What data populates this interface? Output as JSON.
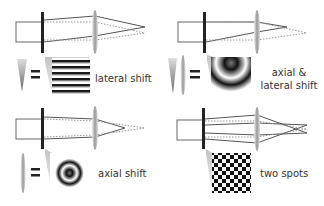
{
  "figure": {
    "panels": [
      {
        "id": "lateral",
        "label_lines": [
          "lateral shift"
        ],
        "pattern": "horizontal-fringes",
        "element_icons": [
          "wedge-prism"
        ]
      },
      {
        "id": "axial-lateral",
        "label_lines": [
          "axial &",
          "lateral shift"
        ],
        "pattern": "off-center-rings",
        "element_icons": [
          "wedge-prism",
          "cylindrical-lens"
        ]
      },
      {
        "id": "axial",
        "label_lines": [
          "axial shift"
        ],
        "pattern": "concentric-rings",
        "element_icons": [
          "cylindrical-lens"
        ]
      },
      {
        "id": "two-spots",
        "label_lines": [
          "two spots"
        ],
        "pattern": "checkerboard",
        "element_icons": []
      }
    ]
  },
  "colors": {
    "line": "#555555",
    "dashed": "#888888",
    "plate": "#222222",
    "lens": "#bbbbbb"
  }
}
